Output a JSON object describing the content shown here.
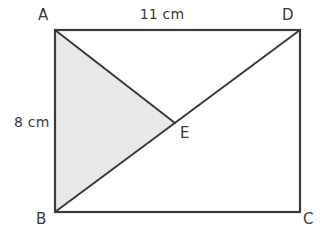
{
  "figure": {
    "type": "geometry-diagram",
    "shape": "rectangle-with-diagonal-and-shaded-triangle",
    "background_color": "#ffffff",
    "stroke_color": "#3a3a3a",
    "shaded_fill_color": "#e8e8e8",
    "text_color": "#3a3a3a"
  },
  "vertices": {
    "a": {
      "label": "A",
      "x": 55,
      "y": 30
    },
    "b": {
      "label": "B",
      "x": 55,
      "y": 212
    },
    "c": {
      "label": "C",
      "x": 300,
      "y": 212
    },
    "d": {
      "label": "D",
      "x": 300,
      "y": 30
    },
    "e": {
      "label": "E",
      "x": 175,
      "y": 123
    }
  },
  "measurements": {
    "top_side": {
      "label": "11 cm",
      "value": 11,
      "unit": "cm",
      "edge": "AD"
    },
    "left_side": {
      "label": "8 cm",
      "value": 8,
      "unit": "cm",
      "edge": "AB"
    }
  },
  "segments": {
    "rectangle": "A-D-C-B",
    "diagonal": "B-E-D",
    "cevian": "A-E"
  },
  "shaded_region": {
    "name": "triangle-abe",
    "points": "A-B-E"
  }
}
